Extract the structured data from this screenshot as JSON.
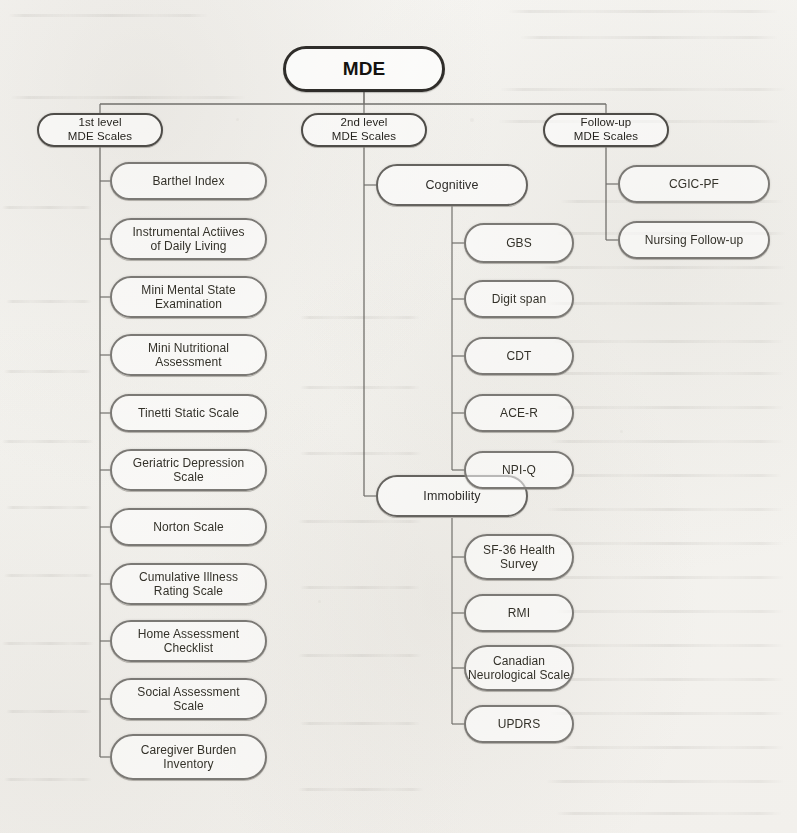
{
  "diagram": {
    "type": "tree",
    "root": {
      "id": "mde",
      "label": "MDE"
    },
    "level1": [
      {
        "id": "first-level",
        "label": "1st level\nMDE Scales"
      },
      {
        "id": "second-level",
        "label": "2nd level\nMDE Scales"
      },
      {
        "id": "follow-up-level",
        "label": "Follow-up\nMDE Scales"
      }
    ],
    "columns": {
      "first_level_scales": [
        {
          "id": "barthel-index",
          "label": "Barthel Index"
        },
        {
          "id": "iadl",
          "label": "Instrumental Actiives\nof Daily Living"
        },
        {
          "id": "mmse",
          "label": "Mini Mental State\nExamination"
        },
        {
          "id": "mna",
          "label": "Mini Nutritional\nAssessment"
        },
        {
          "id": "tinetti",
          "label": "Tinetti Static Scale"
        },
        {
          "id": "gds",
          "label": "Geriatric Depression\nScale"
        },
        {
          "id": "norton",
          "label": "Norton Scale"
        },
        {
          "id": "cirs",
          "label": "Cumulative Illness\nRating Scale"
        },
        {
          "id": "hac",
          "label": "Home Assessment\nChecklist"
        },
        {
          "id": "sas",
          "label": "Social Assessment\nScale"
        },
        {
          "id": "cbi",
          "label": "Caregiver Burden\nInventory"
        }
      ],
      "second_level_branches": [
        {
          "id": "cognitive",
          "label": "Cognitive",
          "children": [
            {
              "id": "gbs",
              "label": "GBS"
            },
            {
              "id": "digit-span",
              "label": "Digit span"
            },
            {
              "id": "cdt",
              "label": "CDT"
            },
            {
              "id": "ace-r",
              "label": "ACE-R"
            },
            {
              "id": "npi-q",
              "label": "NPI-Q"
            }
          ]
        },
        {
          "id": "immobility",
          "label": "Immobility",
          "children": [
            {
              "id": "sf36",
              "label": "SF-36 Health\nSurvey"
            },
            {
              "id": "rmi",
              "label": "RMI"
            },
            {
              "id": "cns",
              "label": "Canadian\nNeurological Scale"
            },
            {
              "id": "updrs",
              "label": "UPDRS"
            }
          ]
        }
      ],
      "follow_up_scales": [
        {
          "id": "cgic-pf",
          "label": "CGIC-PF"
        },
        {
          "id": "nursing-follow-up",
          "label": "Nursing Follow-up"
        }
      ]
    },
    "colors": {
      "paper": "#f4f3ef",
      "root_stroke": "#2f2d2a",
      "node_stroke": "#6c6a66",
      "leaf_stroke": "#7b7975",
      "connector": "#5d5b57",
      "text": "#2e2c29"
    }
  }
}
